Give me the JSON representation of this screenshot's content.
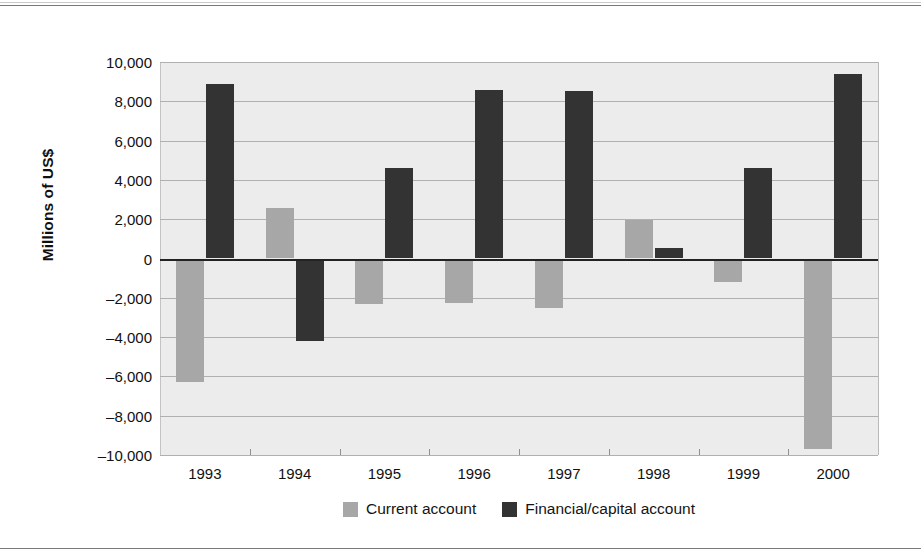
{
  "chart_data": {
    "type": "bar",
    "title": "",
    "xlabel": "",
    "ylabel": "Millions of US$",
    "categories": [
      "1993",
      "1994",
      "1995",
      "1996",
      "1997",
      "1998",
      "1999",
      "2000"
    ],
    "series": [
      {
        "name": "Current account",
        "color": "#a7a7a7",
        "values": [
          -6300,
          2550,
          -2300,
          -2280,
          -2500,
          1950,
          -1200,
          -9700
        ]
      },
      {
        "name": "Financial/capital account",
        "color": "#333333",
        "values": [
          8900,
          -4200,
          4600,
          8600,
          8500,
          550,
          4600,
          9400
        ]
      }
    ],
    "ylim": [
      -10000,
      10000
    ],
    "ytick_values": [
      10000,
      8000,
      6000,
      4000,
      2000,
      0,
      -2000,
      -4000,
      -6000,
      -8000,
      -10000
    ],
    "ytick_labels": [
      "10,000",
      "8,000",
      "6,000",
      "4,000",
      "2,000",
      "0",
      "–2,000",
      "–4,000",
      "–6,000",
      "–8,000",
      "–10,000"
    ],
    "grid": true,
    "legend_position": "bottom-center",
    "zero_line": 0
  },
  "legend": {
    "items": [
      {
        "label": "Current account",
        "swatch": "current"
      },
      {
        "label": "Financial/capital account",
        "swatch": "financial"
      }
    ]
  },
  "colors": {
    "current_account": "#a7a7a7",
    "financial_capital_account": "#333333",
    "plot_background": "#ececec",
    "gridline": "#b0b0b0",
    "zero_line": "#222222"
  }
}
